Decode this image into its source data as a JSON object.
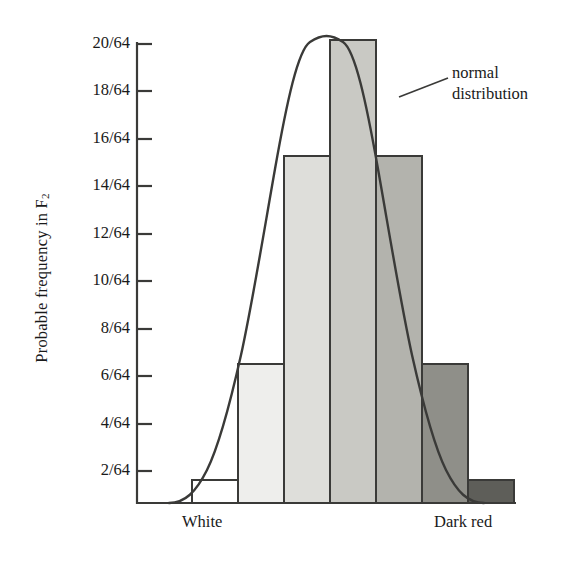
{
  "chart_data": {
    "type": "bar",
    "title": "",
    "subtitle": "",
    "xlabel": "",
    "ylabel": "Probable frequency in F",
    "ylabel_subscript": "2",
    "categories": [
      "1",
      "2",
      "3",
      "4",
      "5",
      "6",
      "7"
    ],
    "values": [
      1,
      6,
      15,
      20,
      15,
      6,
      1
    ],
    "value_labels": [
      "1/64",
      "6/64",
      "15/64",
      "20/64",
      "15/64",
      "6/64",
      "1/64"
    ],
    "denominator": 64,
    "ylim": [
      0,
      21
    ],
    "y_ticks": [
      2,
      4,
      6,
      8,
      10,
      12,
      14,
      16,
      18,
      20
    ],
    "y_tick_labels": [
      "2/64",
      "4/64",
      "6/64",
      "8/64",
      "10/64",
      "12/64",
      "14/64",
      "16/64",
      "18/64",
      "20/64"
    ],
    "grid": false,
    "legend_position": "none",
    "bar_colors": [
      "#ffffff",
      "#eeeeec",
      "#dededa",
      "#c9c9c4",
      "#b3b3ad",
      "#8f8f89",
      "#5e5e59"
    ],
    "bar_edge_color": "#3a3a38",
    "curve_color": "#3a3a38",
    "axis_color": "#3a3a38",
    "x_tick_labels": [
      {
        "text": "White",
        "position": "left"
      },
      {
        "text": "Dark red",
        "position": "right"
      }
    ],
    "annotations": [
      {
        "text_line1": "normal",
        "text_line2": "distribution",
        "target": "curve-right-flank",
        "leader_line": true
      }
    ],
    "series": [
      {
        "name": "F2 phenotype frequency",
        "values": [
          1,
          6,
          15,
          20,
          15,
          6,
          1
        ]
      },
      {
        "name": "normal distribution",
        "type": "curve"
      }
    ]
  },
  "axis": {
    "y_axis_name": "probable-frequency-axis",
    "x_axis_name": "phenotype-axis"
  }
}
